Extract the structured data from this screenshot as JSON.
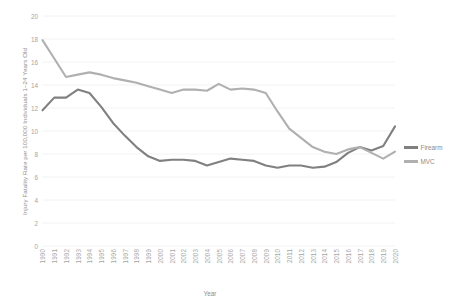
{
  "chart_data": {
    "type": "line",
    "title": "",
    "xlabel": "Year",
    "ylabel": "Injury Fatality Rate per 100,000 Individuals 1–24 Years Old",
    "ylim": [
      0,
      20
    ],
    "yticks": [
      0,
      2,
      4,
      6,
      8,
      10,
      12,
      14,
      16,
      18,
      20
    ],
    "grid": true,
    "legend_position": "right",
    "categories": [
      "1990",
      "1991",
      "1992",
      "1993",
      "1994",
      "1995",
      "1996",
      "1997",
      "1998",
      "1999",
      "2000",
      "2001",
      "2002",
      "2003",
      "2004",
      "2005",
      "2006",
      "2007",
      "2008",
      "2009",
      "2010",
      "2011",
      "2012",
      "2013",
      "2014",
      "2015",
      "2016",
      "2017",
      "2018",
      "2019",
      "2020"
    ],
    "series": [
      {
        "name": "Firearm",
        "color": "#808080",
        "values": [
          11.8,
          12.9,
          12.9,
          13.6,
          13.3,
          12.1,
          10.7,
          9.6,
          8.6,
          7.8,
          7.4,
          7.5,
          7.5,
          7.4,
          7.0,
          7.3,
          7.6,
          7.5,
          7.4,
          7.0,
          6.8,
          7.0,
          7.0,
          6.8,
          6.9,
          7.3,
          8.1,
          8.6,
          8.3,
          8.7,
          10.4
        ]
      },
      {
        "name": "MVC",
        "color": "#b0b0b0",
        "values": [
          17.9,
          16.3,
          14.7,
          14.9,
          15.1,
          14.9,
          14.6,
          14.4,
          14.2,
          13.9,
          13.6,
          13.3,
          13.6,
          13.6,
          13.5,
          14.1,
          13.6,
          13.7,
          13.6,
          13.3,
          11.7,
          10.2,
          9.4,
          8.6,
          8.2,
          8.0,
          8.4,
          8.6,
          8.1,
          7.6,
          8.2
        ]
      }
    ]
  },
  "legend": {
    "items": [
      {
        "label": "Firearm",
        "color": "#808080"
      },
      {
        "label": "MVC",
        "color": "#b0b0b0"
      }
    ]
  },
  "axes": {
    "x_title": "Year",
    "y_title": "Injury Fatality Rate per 100,000 Individuals 1–24 Years Old"
  }
}
